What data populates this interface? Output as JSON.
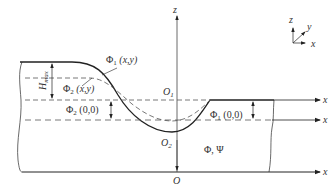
{
  "diagram": {
    "labels": {
      "phi1_xy": "Φ",
      "phi1_xy_sub": "1",
      "phi1_xy_args": " (x,y)",
      "phi2_xy": "Φ",
      "phi2_xy_sub": "2",
      "phi2_xy_args": " (x,y)",
      "phi2_00": "Φ",
      "phi2_00_sub": "2",
      "phi2_00_args": " (0,0)",
      "phi1_00": "Φ",
      "phi1_00_sub": "1",
      "phi1_00_args": " (0,0)",
      "phi_psi": "Φ, Ψ",
      "h_max": "H",
      "h_max_sub": "max",
      "o1": "O",
      "o1_sub": "1",
      "o2": "O",
      "o2_sub": "2",
      "o": "O",
      "z_axis": "z",
      "x_axis_top": "x",
      "x_axis_mid": "x",
      "x_axis_bottom": "x"
    },
    "coordinate_triad": {
      "z": "z",
      "y": "y",
      "x": "x"
    },
    "colors": {
      "line": "#222222",
      "dashed": "#555555",
      "text": "#333333"
    }
  }
}
